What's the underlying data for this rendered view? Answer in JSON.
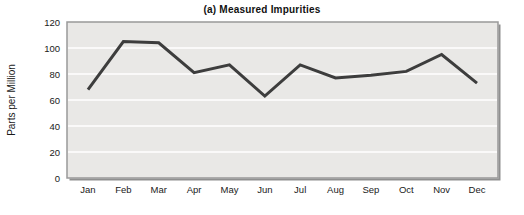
{
  "chart_data": {
    "type": "line",
    "title": "(a) Measured Impurities",
    "xlabel": "",
    "ylabel": "Parts per Million",
    "categories": [
      "Jan",
      "Feb",
      "Mar",
      "Apr",
      "May",
      "Jun",
      "Jul",
      "Aug",
      "Sep",
      "Oct",
      "Nov",
      "Dec"
    ],
    "series": [
      {
        "name": "measured-impurities",
        "values": [
          68,
          105,
          104,
          81,
          87,
          63,
          87,
          77,
          79,
          82,
          95,
          73
        ]
      }
    ],
    "ylim": [
      0,
      120
    ],
    "yticks": [
      0,
      20,
      40,
      60,
      80,
      100,
      120
    ],
    "grid": "horizontal",
    "legend": "none",
    "colors": {
      "line": "#3d3d3d",
      "plot_background": "#e9e8e6",
      "gridline": "#ffffff",
      "frame_border": "#999999",
      "frame_shadow": "#8f8f8f",
      "text": "#1a1a1a",
      "page_background": "#ffffff"
    }
  }
}
